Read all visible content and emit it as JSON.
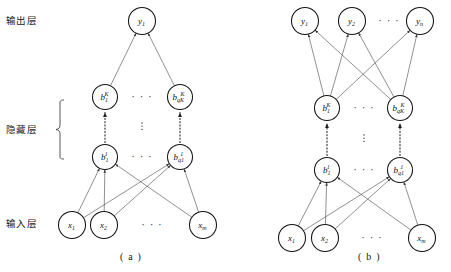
{
  "figure": {
    "background_color": "#ffffff",
    "node_stroke_color": "#141414",
    "edge_color": "#4d4d4d",
    "width": 451,
    "height": 272
  },
  "layer_labels": {
    "output": "输出层",
    "hidden": "隐藏层",
    "input": "输入层"
  },
  "panels": [
    {
      "id": "a",
      "caption": "( a )",
      "output_layer": {
        "nodes": [
          {
            "base": "y",
            "sub": "1",
            "sup": ""
          }
        ]
      },
      "hidden_top_layer": {
        "nodes": [
          {
            "base": "b",
            "sub": "1",
            "sup": "K"
          },
          {
            "base": "b",
            "sub": "qK",
            "sup": "K"
          }
        ],
        "ellipsis": "..."
      },
      "hidden_bottom_layer": {
        "nodes": [
          {
            "base": "b",
            "sub": "1",
            "sup": "1"
          },
          {
            "base": "b",
            "sub": "q1",
            "sup": "1"
          }
        ],
        "ellipsis": "..."
      },
      "input_layer": {
        "nodes": [
          {
            "base": "x",
            "sub": "1",
            "sup": ""
          },
          {
            "base": "x",
            "sub": "2",
            "sup": ""
          },
          {
            "base": "x",
            "sub": "m",
            "sup": ""
          }
        ],
        "ellipsis": "..."
      }
    },
    {
      "id": "b",
      "caption": "( b )",
      "output_layer": {
        "nodes": [
          {
            "base": "y",
            "sub": "1",
            "sup": ""
          },
          {
            "base": "y",
            "sub": "2",
            "sup": ""
          },
          {
            "base": "y",
            "sub": "n",
            "sup": ""
          }
        ],
        "ellipsis": "..."
      },
      "hidden_top_layer": {
        "nodes": [
          {
            "base": "b",
            "sub": "1",
            "sup": "K"
          },
          {
            "base": "b",
            "sub": "qK",
            "sup": "K"
          }
        ],
        "ellipsis": "..."
      },
      "hidden_bottom_layer": {
        "nodes": [
          {
            "base": "b",
            "sub": "1",
            "sup": "1"
          },
          {
            "base": "b",
            "sub": "q1",
            "sup": "1"
          }
        ],
        "ellipsis": "..."
      },
      "input_layer": {
        "nodes": [
          {
            "base": "x",
            "sub": "1",
            "sup": ""
          },
          {
            "base": "x",
            "sub": "2",
            "sup": ""
          },
          {
            "base": "x",
            "sub": "m",
            "sup": ""
          }
        ],
        "ellipsis": "..."
      }
    }
  ]
}
